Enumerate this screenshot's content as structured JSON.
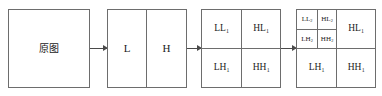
{
  "diagram": {
    "colors": {
      "background": "#ffffff",
      "border": "#6d6d6d",
      "text": "#1b1b1b",
      "arrow": "#4a4a4a"
    },
    "blocks": [
      {
        "id": "original",
        "name": "original-image-block",
        "cells": [
          {
            "name": "original-image",
            "text": "原图",
            "base": "原图",
            "sub": ""
          }
        ]
      },
      {
        "id": "level1-split",
        "name": "lowpass-highpass-block",
        "cells": [
          {
            "name": "lowpass-L",
            "text": "L",
            "base": "L",
            "sub": ""
          },
          {
            "name": "highpass-H",
            "text": "H",
            "base": "H",
            "sub": ""
          }
        ]
      },
      {
        "id": "level1-subbands",
        "name": "level1-subband-block",
        "cells": [
          {
            "name": "subband-LL1",
            "text": "LL1",
            "base": "LL",
            "sub": "1"
          },
          {
            "name": "subband-HL1",
            "text": "HL1",
            "base": "HL",
            "sub": "1"
          },
          {
            "name": "subband-LH1",
            "text": "LH1",
            "base": "LH",
            "sub": "1"
          },
          {
            "name": "subband-HH1",
            "text": "HH1",
            "base": "HH",
            "sub": "1"
          }
        ]
      },
      {
        "id": "level2-subbands",
        "name": "level2-subband-block",
        "cells": [
          {
            "name": "subband-LL2",
            "text": "LL2",
            "base": "LL",
            "sub": "2"
          },
          {
            "name": "subband-HL2",
            "text": "HL2",
            "base": "HL",
            "sub": "2"
          },
          {
            "name": "subband-LH2",
            "text": "LH2",
            "base": "LH",
            "sub": "2"
          },
          {
            "name": "subband-HH2",
            "text": "HH2",
            "base": "HH",
            "sub": "2"
          },
          {
            "name": "subband-HL1",
            "text": "HL1",
            "base": "HL",
            "sub": "1"
          },
          {
            "name": "subband-LH1",
            "text": "LH1",
            "base": "LH",
            "sub": "1"
          },
          {
            "name": "subband-HH1",
            "text": "HH1",
            "base": "HH",
            "sub": "1"
          }
        ]
      }
    ],
    "arrows": [
      {
        "name": "arrow-original-to-split",
        "from": "original",
        "to": "level1-split"
      },
      {
        "name": "arrow-split-to-level1",
        "from": "level1-split",
        "to": "level1-subbands"
      },
      {
        "name": "arrow-level1-to-level2",
        "from": "level1-subbands",
        "to": "level2-subbands"
      }
    ]
  }
}
